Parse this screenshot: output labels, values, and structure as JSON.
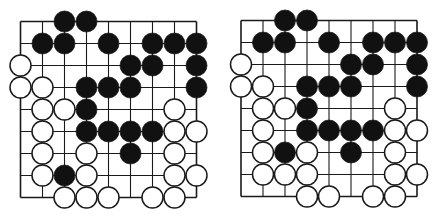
{
  "colors": {
    "black_stone": "#111111",
    "white_stone": "#ffffff",
    "line": "#1a1a1a",
    "background": "#ffffff"
  },
  "boards": [
    {
      "name": "left",
      "size": 9,
      "stones": {
        "black": [
          [
            0,
            2
          ],
          [
            0,
            3
          ],
          [
            1,
            1
          ],
          [
            1,
            2
          ],
          [
            1,
            4
          ],
          [
            1,
            6
          ],
          [
            1,
            7
          ],
          [
            1,
            8
          ],
          [
            2,
            5
          ],
          [
            2,
            6
          ],
          [
            2,
            8
          ],
          [
            3,
            3
          ],
          [
            3,
            4
          ],
          [
            3,
            5
          ],
          [
            3,
            8
          ],
          [
            4,
            3
          ],
          [
            5,
            3
          ],
          [
            5,
            4
          ],
          [
            5,
            5
          ],
          [
            5,
            6
          ],
          [
            6,
            5
          ],
          [
            7,
            2
          ]
        ],
        "white": [
          [
            2,
            0
          ],
          [
            3,
            0
          ],
          [
            3,
            1
          ],
          [
            4,
            1
          ],
          [
            4,
            2
          ],
          [
            4,
            7
          ],
          [
            5,
            1
          ],
          [
            5,
            7
          ],
          [
            5,
            8
          ],
          [
            6,
            1
          ],
          [
            6,
            3
          ],
          [
            6,
            7
          ],
          [
            7,
            1
          ],
          [
            7,
            3
          ],
          [
            7,
            7
          ],
          [
            7,
            8
          ],
          [
            8,
            2
          ],
          [
            8,
            3
          ],
          [
            8,
            4
          ],
          [
            8,
            6
          ],
          [
            8,
            7
          ]
        ]
      }
    },
    {
      "name": "right",
      "size": 9,
      "stones": {
        "black": [
          [
            0,
            2
          ],
          [
            0,
            3
          ],
          [
            1,
            1
          ],
          [
            1,
            2
          ],
          [
            1,
            4
          ],
          [
            1,
            6
          ],
          [
            1,
            7
          ],
          [
            1,
            8
          ],
          [
            2,
            5
          ],
          [
            2,
            6
          ],
          [
            2,
            8
          ],
          [
            3,
            3
          ],
          [
            3,
            4
          ],
          [
            3,
            5
          ],
          [
            3,
            8
          ],
          [
            4,
            3
          ],
          [
            5,
            3
          ],
          [
            5,
            4
          ],
          [
            5,
            5
          ],
          [
            5,
            6
          ],
          [
            6,
            2
          ],
          [
            6,
            5
          ]
        ],
        "white": [
          [
            2,
            0
          ],
          [
            3,
            0
          ],
          [
            3,
            1
          ],
          [
            4,
            1
          ],
          [
            4,
            2
          ],
          [
            4,
            7
          ],
          [
            5,
            1
          ],
          [
            5,
            7
          ],
          [
            5,
            8
          ],
          [
            6,
            1
          ],
          [
            6,
            3
          ],
          [
            6,
            7
          ],
          [
            7,
            1
          ],
          [
            7,
            2
          ],
          [
            7,
            3
          ],
          [
            7,
            7
          ],
          [
            7,
            8
          ],
          [
            8,
            3
          ],
          [
            8,
            4
          ],
          [
            8,
            6
          ],
          [
            8,
            7
          ]
        ]
      }
    }
  ]
}
